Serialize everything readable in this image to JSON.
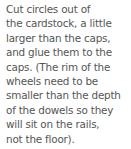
{
  "instruction": {
    "lines": [
      "Cut circles out of",
      "the cardstock, a little",
      "larger than the caps,",
      "and glue them to the",
      "caps. (The rim of the",
      "wheels need to be",
      "smaller than the depth",
      "of the dowels so they",
      "will sit on the rails,",
      "not the floor)."
    ],
    "text_color": "#555555"
  }
}
